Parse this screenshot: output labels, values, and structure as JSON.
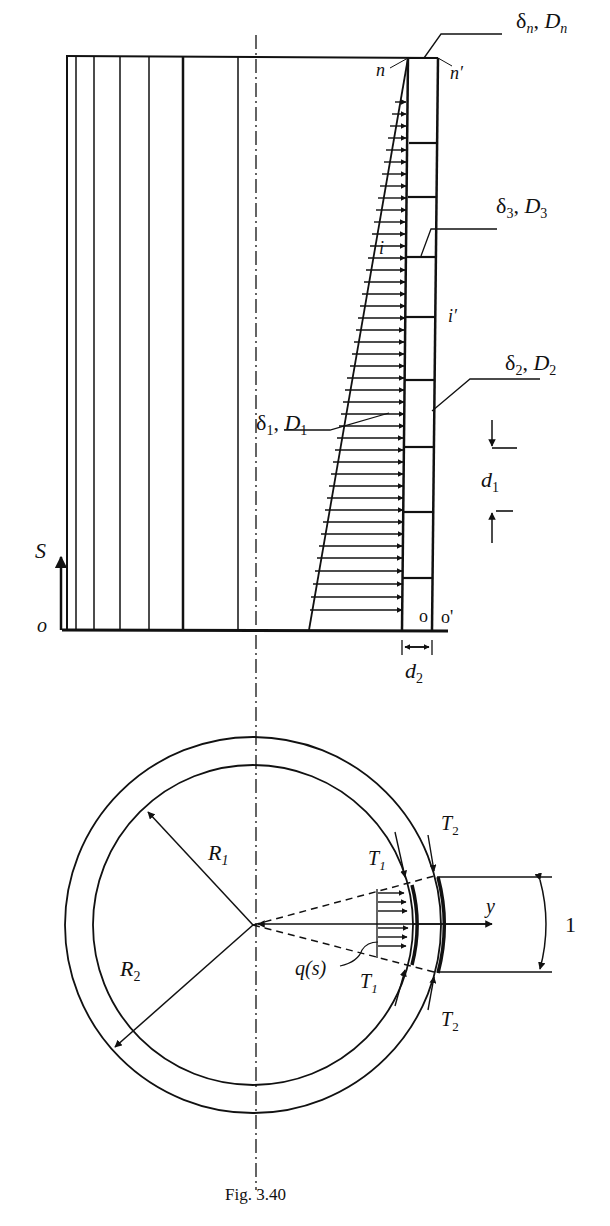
{
  "figure": {
    "caption": "Fig. 3.40",
    "top_view": {
      "labels": {
        "dn": "δ",
        "dn_sub": "n",
        "Dn": "D",
        "Dn_sub": "n",
        "n": "n",
        "n_prime": "n′",
        "d3": "δ",
        "d3_sub": "3",
        "D3": "D",
        "D3_sub": "3",
        "i": "i",
        "i_prime": "i′",
        "d2": "δ",
        "d2_sub": "2",
        "D2": "D",
        "D2_sub": "2",
        "d1": "δ",
        "d1_sub": "1",
        "D1": "D",
        "D1_sub": "1",
        "dim_d1": "d",
        "dim_d1_sub": "1",
        "dim_d2": "d",
        "dim_d2_sub": "2",
        "S": "S",
        "o": "o",
        "o_small": "o",
        "o_prime": "o'"
      }
    },
    "bottom_view": {
      "labels": {
        "R1": "R",
        "R1_sub": "1",
        "R2": "R",
        "R2_sub": "2",
        "T1_top": "T",
        "T1_top_sub": "1",
        "T1_bot": "T",
        "T1_bot_sub": "1",
        "T2_top": "T",
        "T2_top_sub": "2",
        "T2_bot": "T",
        "T2_bot_sub": "2",
        "y": "y",
        "q": "q(s)",
        "one": "1"
      }
    }
  }
}
